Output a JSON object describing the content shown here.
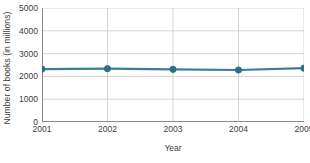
{
  "chart_data": {
    "type": "line",
    "title": "",
    "xlabel": "Year",
    "ylabel": "Number of books (in millions)",
    "categories": [
      "2001",
      "2002",
      "2003",
      "2004",
      "2005"
    ],
    "x": [
      2001,
      2002,
      2003,
      2004,
      2005
    ],
    "values": [
      2320,
      2340,
      2310,
      2280,
      2360
    ],
    "series": [
      {
        "name": "Number of books",
        "values": [
          2320,
          2340,
          2310,
          2280,
          2360
        ]
      }
    ],
    "ylim": [
      0,
      5000
    ],
    "xlim": [
      2001,
      2005
    ],
    "yticks": [
      0,
      1000,
      2000,
      3000,
      4000,
      5000
    ],
    "ytick_labels": [
      "0",
      "1000",
      "2000",
      "3000",
      "4000",
      "5000"
    ],
    "xticks": [
      2001,
      2002,
      2003,
      2004,
      2005
    ],
    "xtick_labels": [
      "2001",
      "2002",
      "2003",
      "2004",
      "2005"
    ],
    "grid": "both",
    "legend": "none",
    "marker": "circle",
    "colors": {
      "line": "#3a7d96",
      "marker": "#2f6e87",
      "grid": "#c9c9c9",
      "axis": "#8a8a8a",
      "text": "#3d3d3d",
      "background": "#ffffff"
    }
  }
}
